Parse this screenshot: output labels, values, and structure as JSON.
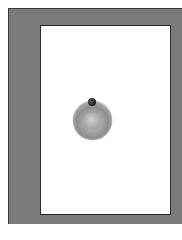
{
  "window": {
    "frame_color": "#7a7a7a",
    "panel_color": "#ffffff",
    "border_color": "#2a2a2a"
  },
  "control": {
    "type": "rotary-knob",
    "body_color": "#a8a8a8",
    "indicator_color": "#1a1a1a",
    "indicator_position": "top"
  }
}
